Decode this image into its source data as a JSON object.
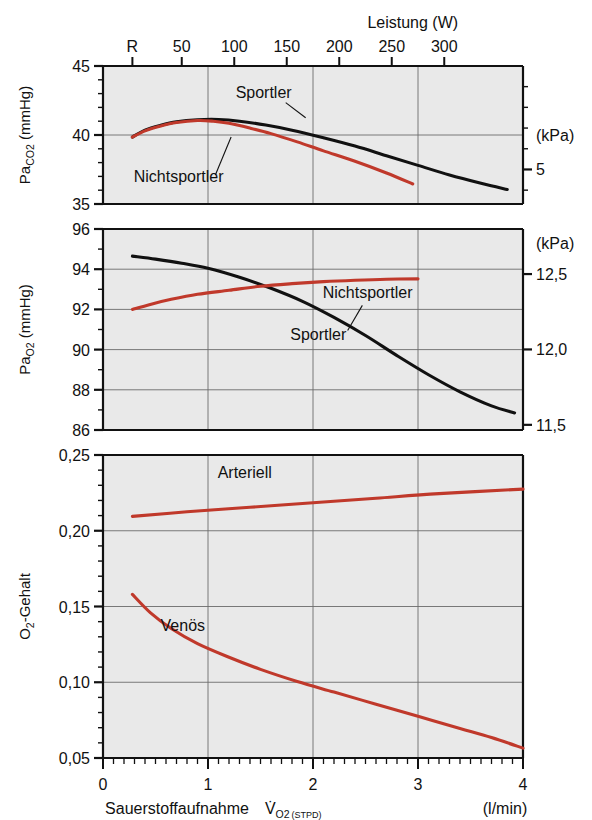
{
  "figure": {
    "background": "#ffffff",
    "panel_fill": "#e9e9e9",
    "grid_color": "#6b6b6b",
    "axis_color": "#111111",
    "color_black": "#111111",
    "color_red": "#c0392b"
  },
  "top_axis": {
    "title": "Leistung (W)",
    "tick_labels": [
      "R",
      "50",
      "100",
      "150",
      "200",
      "250",
      "300"
    ],
    "tick_values": [
      0.28,
      0.75,
      1.25,
      1.75,
      2.25,
      2.75,
      3.25
    ]
  },
  "bottom_axis": {
    "label_main": "Sauerstoffaufnahme",
    "label_symbol": "V",
    "label_symbol_sub": "O",
    "label_symbol_sub_num": "2",
    "label_symbol_cond": "(STPD)",
    "unit": "(l/min)",
    "tick_labels": [
      "0",
      "1",
      "2",
      "3",
      "4"
    ],
    "tick_values": [
      0,
      1,
      2,
      3,
      4
    ],
    "minor_step": 0.1,
    "range": [
      0,
      4
    ]
  },
  "panels": [
    {
      "id": "paco2",
      "ylabel_main": "Pa",
      "ylabel_sub": "CO",
      "ylabel_sub_num": "2",
      "ylabel_unit": "(mmHg)",
      "ylim": [
        35,
        45
      ],
      "yticks": [
        35,
        40,
        45
      ],
      "ytick_labels": [
        "35",
        "40",
        "45"
      ],
      "yminor_step": 1,
      "ygrid": [
        40
      ],
      "right_axis": {
        "unit": "(kPa)",
        "unit_at": 40,
        "ticks": [
          5,
          6
        ],
        "tick_labels": [
          "5",
          "6"
        ],
        "tick_values_mmhg": [
          37.503,
          45.004
        ],
        "minor_ticks_mmhg": [
          36.003,
          37.503,
          39.003,
          40.503,
          42.004,
          43.504,
          45.004
        ]
      },
      "series": [
        {
          "name": "Sportler",
          "color": "#111111",
          "label": "Sportler",
          "label_x": 1.53,
          "label_y": 42.7,
          "leader": [
            [
              1.74,
              42.35
            ],
            [
              1.93,
              41.25
            ]
          ],
          "points": [
            [
              0.28,
              39.85
            ],
            [
              0.4,
              40.35
            ],
            [
              0.55,
              40.7
            ],
            [
              0.7,
              40.95
            ],
            [
              0.9,
              41.1
            ],
            [
              1.1,
              41.12
            ],
            [
              1.3,
              41.0
            ],
            [
              1.55,
              40.72
            ],
            [
              1.8,
              40.35
            ],
            [
              2.1,
              39.8
            ],
            [
              2.4,
              39.2
            ],
            [
              2.7,
              38.5
            ],
            [
              3.0,
              37.8
            ],
            [
              3.3,
              37.1
            ],
            [
              3.6,
              36.5
            ],
            [
              3.85,
              36.05
            ]
          ]
        },
        {
          "name": "Nichtsportler",
          "color": "#c0392b",
          "label": "Nichtsportler",
          "label_x": 0.72,
          "label_y": 36.6,
          "leader": [
            [
              1.07,
              37.1
            ],
            [
              1.22,
              39.85
            ]
          ],
          "points": [
            [
              0.28,
              39.85
            ],
            [
              0.4,
              40.3
            ],
            [
              0.55,
              40.65
            ],
            [
              0.7,
              40.9
            ],
            [
              0.9,
              41.05
            ],
            [
              1.05,
              41.0
            ],
            [
              1.2,
              40.85
            ],
            [
              1.4,
              40.5
            ],
            [
              1.6,
              40.1
            ],
            [
              1.85,
              39.5
            ],
            [
              2.1,
              38.85
            ],
            [
              2.4,
              38.1
            ],
            [
              2.7,
              37.25
            ],
            [
              2.95,
              36.45
            ]
          ]
        }
      ]
    },
    {
      "id": "pao2",
      "ylabel_main": "Pa",
      "ylabel_sub": "O",
      "ylabel_sub_num": "2",
      "ylabel_unit": "(mmHg)",
      "ylim": [
        86,
        96
      ],
      "yticks": [
        86,
        88,
        90,
        92,
        94,
        96
      ],
      "ytick_labels": [
        "86",
        "88",
        "90",
        "92",
        "94",
        "96"
      ],
      "yminor_step": 1,
      "ygrid": [
        88,
        90,
        92,
        94
      ],
      "right_axis": {
        "unit": "(kPa)",
        "unit_at": 95.3,
        "ticks": [
          11.5,
          12.0,
          12.5
        ],
        "tick_labels": [
          "11,5",
          "12,0",
          "12,5"
        ],
        "tick_values_mmhg": [
          86.257,
          90.008,
          93.758
        ]
      },
      "series": [
        {
          "name": "Sportler",
          "color": "#111111",
          "label": "Sportler",
          "label_x": 2.05,
          "label_y": 90.5,
          "leader": [
            [
              2.33,
              90.95
            ],
            [
              2.47,
              92.2
            ]
          ],
          "points": [
            [
              0.28,
              94.65
            ],
            [
              0.5,
              94.5
            ],
            [
              0.75,
              94.3
            ],
            [
              1.0,
              94.05
            ],
            [
              1.3,
              93.6
            ],
            [
              1.6,
              93.05
            ],
            [
              1.9,
              92.4
            ],
            [
              2.2,
              91.6
            ],
            [
              2.5,
              90.7
            ],
            [
              2.8,
              89.7
            ],
            [
              3.1,
              88.75
            ],
            [
              3.4,
              87.9
            ],
            [
              3.7,
              87.2
            ],
            [
              3.92,
              86.85
            ]
          ]
        },
        {
          "name": "Nichtsportler",
          "color": "#c0392b",
          "label": "Nichtsportler",
          "label_x": 2.52,
          "label_y": 92.55,
          "leader": null,
          "points": [
            [
              0.28,
              92.0
            ],
            [
              0.45,
              92.25
            ],
            [
              0.65,
              92.5
            ],
            [
              0.9,
              92.75
            ],
            [
              1.2,
              92.95
            ],
            [
              1.5,
              93.15
            ],
            [
              1.8,
              93.28
            ],
            [
              2.1,
              93.38
            ],
            [
              2.4,
              93.45
            ],
            [
              2.7,
              93.5
            ],
            [
              3.0,
              93.52
            ]
          ]
        }
      ]
    },
    {
      "id": "o2content",
      "ylabel_main": "O",
      "ylabel_sub_num": "2",
      "ylabel_suffix": "-Gehalt",
      "ylabel_unit": "",
      "ylim": [
        0.05,
        0.25
      ],
      "yticks": [
        0.05,
        0.1,
        0.15,
        0.2,
        0.25
      ],
      "ytick_labels": [
        "0,05",
        "0,10",
        "0,15",
        "0,20",
        "0,25"
      ],
      "yminor_step": 0.01,
      "ygrid": [
        0.1,
        0.15,
        0.2
      ],
      "right_axis": null,
      "series": [
        {
          "name": "Arteriell",
          "color": "#c0392b",
          "label": "Arteriell",
          "label_x": 1.35,
          "label_y": 0.2345,
          "leader": null,
          "points": [
            [
              0.28,
              0.2095
            ],
            [
              0.8,
              0.2125
            ],
            [
              1.4,
              0.2155
            ],
            [
              2.0,
              0.2185
            ],
            [
              2.6,
              0.2215
            ],
            [
              3.2,
              0.2245
            ],
            [
              4.0,
              0.2275
            ]
          ]
        },
        {
          "name": "Venös",
          "color": "#c0392b",
          "label": "Venös",
          "label_x": 0.76,
          "label_y": 0.1335,
          "leader": null,
          "points": [
            [
              0.28,
              0.158
            ],
            [
              0.45,
              0.146
            ],
            [
              0.65,
              0.1355
            ],
            [
              0.9,
              0.1255
            ],
            [
              1.2,
              0.1165
            ],
            [
              1.5,
              0.1085
            ],
            [
              1.85,
              0.1005
            ],
            [
              2.2,
              0.0935
            ],
            [
              2.6,
              0.0855
            ],
            [
              3.0,
              0.0775
            ],
            [
              3.4,
              0.0695
            ],
            [
              3.7,
              0.0635
            ],
            [
              4.0,
              0.0565
            ]
          ]
        }
      ]
    }
  ]
}
